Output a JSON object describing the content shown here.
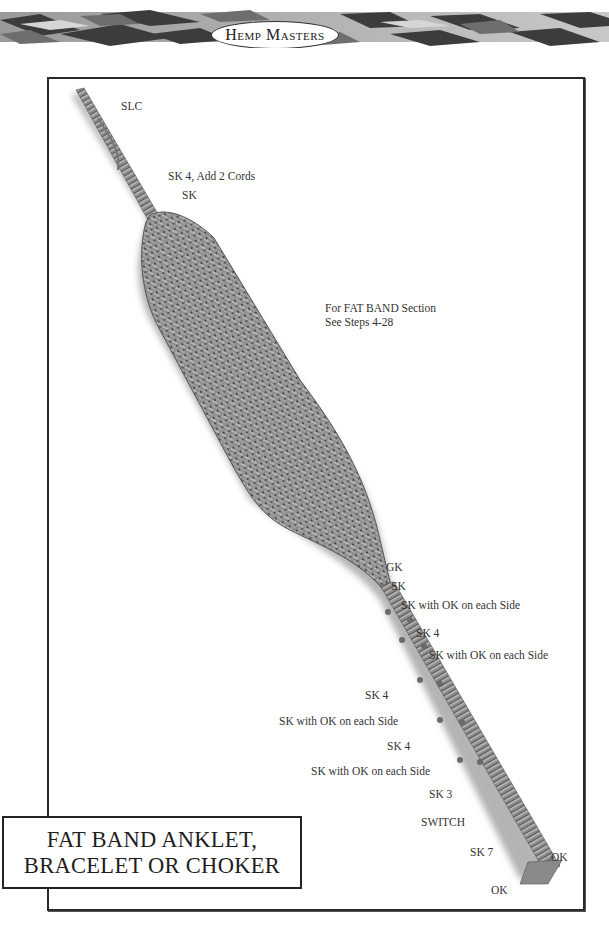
{
  "header": {
    "brand": "Hemp Masters"
  },
  "diagram": {
    "labels": [
      {
        "id": "slc",
        "text": "SLC"
      },
      {
        "id": "sk4-add",
        "text": "SK 4, Add 2 Cords"
      },
      {
        "id": "sk-top",
        "text": "SK"
      },
      {
        "id": "fat-band-line1",
        "text": "For FAT BAND Section"
      },
      {
        "id": "fat-band-line2",
        "text": "See Steps 4-28"
      },
      {
        "id": "gk",
        "text": "GK"
      },
      {
        "id": "sk-1",
        "text": "SK"
      },
      {
        "id": "sk-ok-1",
        "text": "SK with OK on each Side"
      },
      {
        "id": "sk4-1",
        "text": "SK 4"
      },
      {
        "id": "sk-ok-2",
        "text": "SK with OK on each Side"
      },
      {
        "id": "sk4-2",
        "text": "SK 4"
      },
      {
        "id": "sk-ok-3",
        "text": "SK with OK on each Side"
      },
      {
        "id": "sk4-3",
        "text": "SK 4"
      },
      {
        "id": "sk-ok-4",
        "text": "SK with OK on each Side"
      },
      {
        "id": "sk3",
        "text": "SK 3"
      },
      {
        "id": "switch",
        "text": "SWITCH"
      },
      {
        "id": "sk7",
        "text": "SK 7"
      },
      {
        "id": "ok-right",
        "text": "OK"
      },
      {
        "id": "ok-bottom",
        "text": "OK"
      }
    ]
  },
  "title": {
    "line1": "FAT BAND ANKLET,",
    "line2": "BRACELET OR CHOKER"
  },
  "colors": {
    "braid_dark": "#3a3a3a",
    "braid_mid": "#7a7a7a",
    "braid_light": "#b8b8b8",
    "hemp": "#8c8c8c",
    "frame": "#2a2a2a"
  }
}
